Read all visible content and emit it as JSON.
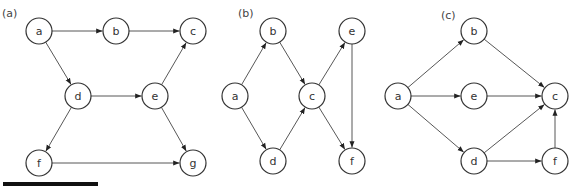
{
  "radius": 13,
  "colors": {
    "stroke": "#333333",
    "edge": "#444444",
    "fill": "#ffffff",
    "bar": "#111111"
  },
  "panels": [
    {
      "label": "(a)",
      "label_pos": [
        2,
        17
      ],
      "nodes": [
        {
          "id": "a",
          "x": 39,
          "y": 31
        },
        {
          "id": "b",
          "x": 116,
          "y": 31
        },
        {
          "id": "c",
          "x": 193,
          "y": 31
        },
        {
          "id": "d",
          "x": 78,
          "y": 96
        },
        {
          "id": "e",
          "x": 155,
          "y": 96
        },
        {
          "id": "f",
          "x": 39,
          "y": 163
        },
        {
          "id": "g",
          "x": 193,
          "y": 163
        }
      ],
      "edges": [
        [
          "a",
          "b"
        ],
        [
          "b",
          "c"
        ],
        [
          "a",
          "d"
        ],
        [
          "d",
          "e"
        ],
        [
          "e",
          "c"
        ],
        [
          "e",
          "g"
        ],
        [
          "d",
          "f"
        ],
        [
          "f",
          "g"
        ]
      ]
    },
    {
      "label": "(b)",
      "label_pos": [
        238,
        17
      ],
      "nodes": [
        {
          "id": "a",
          "x": 235,
          "y": 96
        },
        {
          "id": "b",
          "x": 273,
          "y": 31
        },
        {
          "id": "c",
          "x": 312,
          "y": 96
        },
        {
          "id": "d",
          "x": 273,
          "y": 161
        },
        {
          "id": "e",
          "x": 352,
          "y": 31
        },
        {
          "id": "f",
          "x": 352,
          "y": 161
        }
      ],
      "edges": [
        [
          "a",
          "b"
        ],
        [
          "a",
          "d"
        ],
        [
          "b",
          "c"
        ],
        [
          "d",
          "c"
        ],
        [
          "c",
          "e"
        ],
        [
          "c",
          "f"
        ],
        [
          "e",
          "f"
        ]
      ]
    },
    {
      "label": "(c)",
      "label_pos": [
        441,
        19
      ],
      "nodes": [
        {
          "id": "a",
          "x": 398,
          "y": 96
        },
        {
          "id": "b",
          "x": 474,
          "y": 31
        },
        {
          "id": "e",
          "x": 474,
          "y": 96
        },
        {
          "id": "c",
          "x": 555,
          "y": 96
        },
        {
          "id": "d",
          "x": 474,
          "y": 161
        },
        {
          "id": "f",
          "x": 555,
          "y": 161
        }
      ],
      "edges": [
        [
          "a",
          "b"
        ],
        [
          "a",
          "e"
        ],
        [
          "a",
          "d"
        ],
        [
          "b",
          "c"
        ],
        [
          "e",
          "c"
        ],
        [
          "d",
          "c"
        ],
        [
          "d",
          "f"
        ],
        [
          "f",
          "c"
        ]
      ]
    }
  ]
}
